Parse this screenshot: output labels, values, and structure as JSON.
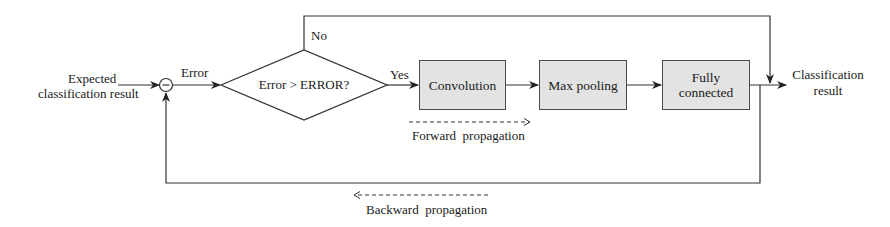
{
  "diagram": {
    "input": {
      "label_line1": "Expected",
      "label_line2": "classification result"
    },
    "summing_junction": {
      "symbol": "−"
    },
    "error_label": "Error",
    "decision": {
      "label": "Error > ERROR?",
      "yes_label": "Yes",
      "no_label": "No"
    },
    "blocks": [
      {
        "label": "Convolution"
      },
      {
        "label": "Max pooling"
      },
      {
        "label_line1": "Fully",
        "label_line2": "connected"
      }
    ],
    "output": {
      "label_line1": "Classification",
      "label_line2": "result"
    },
    "forward_propagation": "Forward  propagation",
    "backward_propagation": "Backward  propagation"
  },
  "colors": {
    "line": "#333333",
    "box_fill": "#e3e3e3",
    "box_border": "#4a4a4a"
  }
}
